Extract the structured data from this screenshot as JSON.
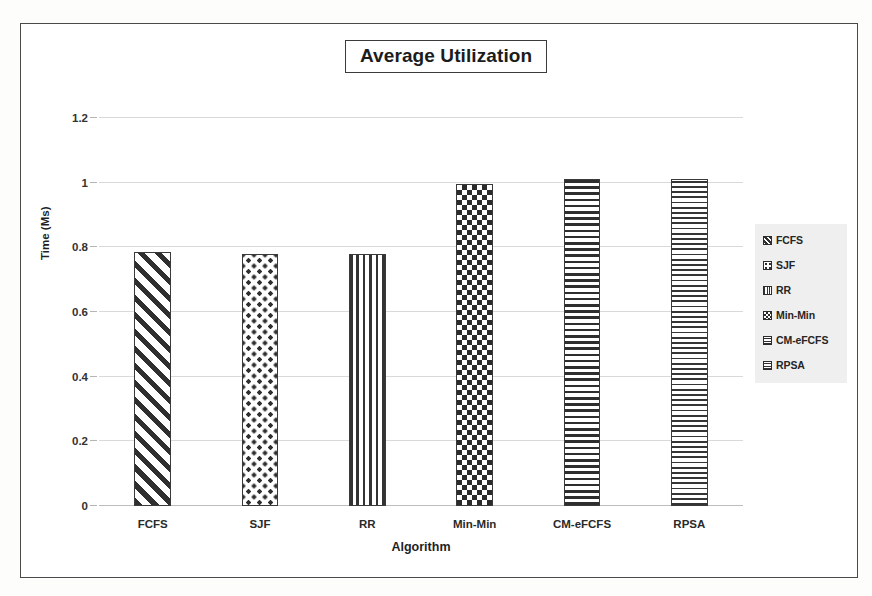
{
  "figure": {
    "title": "Average Utilization",
    "frame_color": "#4a4a4a",
    "background": "#ffffff"
  },
  "chart_data": {
    "type": "bar",
    "title": "Average Utilization",
    "xlabel": "Algorithm",
    "ylabel": "Time (Ms)",
    "categories": [
      "FCFS",
      "SJF",
      "RR",
      "Min-Min",
      "CM-eFCFS",
      "RPSA"
    ],
    "values": [
      0.785,
      0.78,
      0.78,
      0.995,
      1.01,
      1.01
    ],
    "ylim": [
      0,
      1.2
    ],
    "yticks": [
      0,
      0.2,
      0.4,
      0.6,
      0.8,
      1,
      1.2
    ],
    "ytick_labels": [
      "0",
      "0.2",
      "0.4",
      "0.6",
      "0.8",
      "1",
      "1.2"
    ],
    "grid": true,
    "grid_axis": "y",
    "legend_position": "right",
    "legend": [
      "FCFS",
      "SJF",
      "RR",
      "Min-Min",
      "CM-eFCFS",
      "RPSA"
    ],
    "bar_patterns": [
      "diagonal-stripes",
      "dot-lattice",
      "vertical-lines",
      "checkerboard",
      "horizontal-lines",
      "fine-grid"
    ]
  },
  "axes": {
    "x_title": "Algorithm",
    "y_title": "Time (Ms)"
  },
  "legend": {
    "items": [
      {
        "label": "FCFS",
        "pattern": "diagonal-stripes"
      },
      {
        "label": "SJF",
        "pattern": "dot-lattice"
      },
      {
        "label": "RR",
        "pattern": "vertical-lines"
      },
      {
        "label": "Min-Min",
        "pattern": "checkerboard"
      },
      {
        "label": "CM-eFCFS",
        "pattern": "horizontal-lines"
      },
      {
        "label": "RPSA",
        "pattern": "fine-grid"
      }
    ]
  }
}
